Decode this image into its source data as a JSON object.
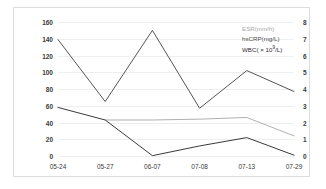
{
  "chart_data": {
    "type": "line",
    "title": "",
    "xlabel": "",
    "ylabel": "",
    "categories": [
      "05-24",
      "05-27",
      "06-07",
      "07-08",
      "07-13",
      "07-29"
    ],
    "ylim": [
      0,
      160
    ],
    "yticks": [
      0,
      20,
      40,
      60,
      80,
      100,
      120,
      140,
      160
    ],
    "y2lim": [
      0,
      8
    ],
    "y2ticks": [
      0,
      1,
      2,
      3,
      4,
      5,
      6,
      7,
      8
    ],
    "grid": true,
    "legend_position": "top-right",
    "series": [
      {
        "name": "ESR(mm/h)",
        "axis": "left",
        "color": "#b0b0b0",
        "values": [
          null,
          43,
          43,
          44,
          46,
          24
        ]
      },
      {
        "name": "hsCRP(mg/L)",
        "axis": "left",
        "color": "#555555",
        "values": [
          139,
          65,
          150,
          57,
          102,
          77
        ]
      },
      {
        "name": "WBC( × 10⁹/L)",
        "axis": "right",
        "color": "#3a3a3a",
        "values": [
          2.9,
          2.15,
          0.02,
          0.6,
          1.1,
          0.05
        ]
      }
    ]
  },
  "legend": {
    "esr_label": "ESR(mm/h)",
    "hscrp_label": "hsCRP(mg/L)",
    "wbc_label_prefix": "WBC( × 10",
    "wbc_label_exp": "9",
    "wbc_label_suffix": "/L)"
  }
}
